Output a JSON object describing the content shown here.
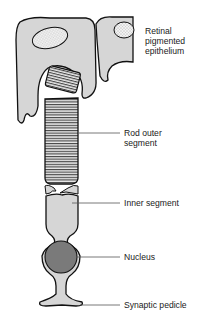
{
  "diagram": {
    "colors": {
      "cell_fill": "#d6d6d6",
      "outline": "#111111",
      "nucleus_fill": "#7a7a7a",
      "stipple_fill": "#f4f4f4",
      "leader_line": "#555555"
    },
    "labels": [
      {
        "id": "rpe",
        "text": "Retinal\npigmented\nepithelium"
      },
      {
        "id": "rod-outer-segment",
        "text": "Rod outer\nsegment"
      },
      {
        "id": "inner-segment",
        "text": "Inner segment"
      },
      {
        "id": "nucleus",
        "text": "Nucleus"
      },
      {
        "id": "synaptic-pedicle",
        "text": "Synaptic pedicle"
      }
    ]
  }
}
